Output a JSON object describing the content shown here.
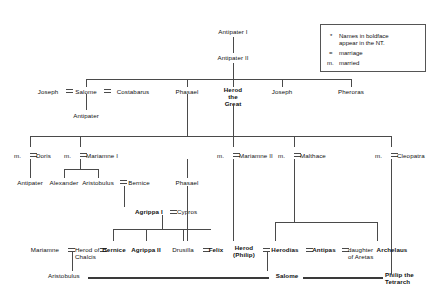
{
  "legend": {
    "star": "*",
    "note": "Names in boldface\nappear in the NT.",
    "marriage_symbol": "=",
    "marriage_label": "marriage",
    "married_symbol": "m.",
    "married_label": "married"
  },
  "generations": {
    "gen1": {
      "name": "Antipater I"
    },
    "gen2": {
      "name": "Antipater II"
    },
    "gen3": [
      {
        "name": "Joseph",
        "bold": false
      },
      {
        "name": "Salome",
        "bold": false
      },
      {
        "name": "Costabarus",
        "bold": false
      },
      {
        "name": "Phasael",
        "bold": false
      },
      {
        "name": "Herod\nthe\nGreat",
        "bold": true
      },
      {
        "name": "Joseph",
        "bold": false
      },
      {
        "name": "Pheroras",
        "bold": false
      }
    ],
    "gen3b": {
      "name": "Antipater"
    },
    "wives": [
      {
        "prefix": "m.",
        "name": "Doris"
      },
      {
        "prefix": "m.",
        "name": "Mariamne I"
      },
      {
        "prefix": "m.",
        "name": "Mariamne II"
      },
      {
        "prefix": "m.",
        "name": "Malthace"
      },
      {
        "prefix": "m.",
        "name": "Cleopatra"
      }
    ],
    "gen4": [
      {
        "name": "Antipater",
        "bold": false
      },
      {
        "name": "Alexander",
        "bold": false
      },
      {
        "name": "Aristobulus",
        "bold": false
      },
      {
        "name": "Bernice",
        "bold": false
      },
      {
        "name": "Phasael",
        "bold": false
      }
    ],
    "gen5": [
      {
        "name": "Agrippa I",
        "bold": true
      },
      {
        "name": "Cypros",
        "bold": false
      }
    ],
    "gen6": [
      {
        "name": "Mariamne",
        "bold": false
      },
      {
        "name": "Herod of\nChalcis",
        "bold": false
      },
      {
        "name": "Bernice",
        "bold": true
      },
      {
        "name": "Agrippa II",
        "bold": true
      },
      {
        "name": "Drusilla",
        "bold": false
      },
      {
        "name": "Felix",
        "bold": true
      },
      {
        "name": "Herod\n(Philip)",
        "bold": true
      },
      {
        "name": "Herodias",
        "bold": true
      },
      {
        "name": "Antipas",
        "bold": true
      },
      {
        "name": "daughter\nof Aretas",
        "bold": false
      },
      {
        "name": "Archelaus",
        "bold": true
      }
    ],
    "gen7": [
      {
        "name": "Aristobulus",
        "bold": false
      },
      {
        "name": "Salome",
        "bold": true
      },
      {
        "name": "Philip the\nTetrarch",
        "bold": true
      }
    ]
  }
}
